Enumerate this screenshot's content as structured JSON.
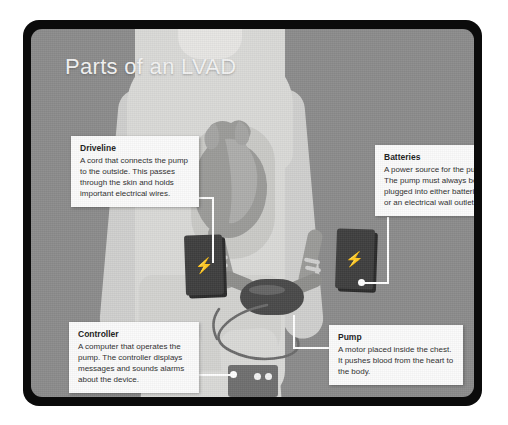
{
  "figure": {
    "title": "Parts of an LVAD",
    "background_color": "#8b8b8b",
    "frame_color": "#0b0b0b",
    "body_color": "#d9d9d7",
    "callout_bg": "#fbfbfb",
    "leader_color": "#ffffff"
  },
  "callouts": [
    {
      "id": "driveline",
      "title": "Driveline",
      "body": "A cord that connects the pump to the outside. This passes through the skin and holds important electrical wires."
    },
    {
      "id": "batteries",
      "title": "Batteries",
      "body": "A power source for the pump. The pump must always be plugged into either batteries or an electrical wall outlet."
    },
    {
      "id": "controller",
      "title": "Controller",
      "body": "A computer that operates the pump. The controller displays messages and sounds alarms about the device."
    },
    {
      "id": "pump",
      "title": "Pump",
      "body": "A motor placed inside the chest. It pushes blood from the heart to the body."
    }
  ],
  "devices": {
    "battery_left": {
      "icon": "lightning-bolt-icon",
      "glyph": "⚡",
      "color": "#3f3f3f"
    },
    "battery_right": {
      "icon": "lightning-bolt-icon",
      "glyph": "⚡",
      "color": "#3f3f3f"
    },
    "controller": {
      "color": "#6f6f6f",
      "indicator_count": 2,
      "indicator_color": "#f2f2f2"
    },
    "pump": {
      "color": "#4a4a4a"
    },
    "heart": {
      "color": "#9b9b99"
    }
  }
}
